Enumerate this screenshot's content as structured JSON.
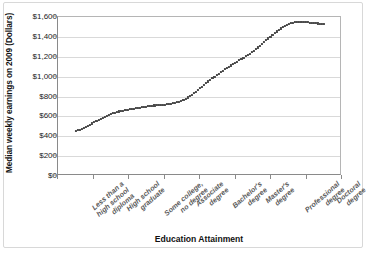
{
  "chart_data": {
    "type": "line",
    "title": "",
    "xlabel": "Education Attainment",
    "ylabel": "Median weekly earnings on 2009 (Dollars)",
    "categories": [
      "Less than a high school diploma",
      "High school graduate",
      "Some college, no degree",
      "Associate degree",
      "Bachelor's degree",
      "Master's degree",
      "Professional degree",
      "Doctoral degree"
    ],
    "values": [
      454,
      626,
      699,
      761,
      1025,
      1257,
      1529,
      1532
    ],
    "ylim": [
      0,
      1600
    ],
    "ytick_values": [
      0,
      200,
      400,
      600,
      800,
      1000,
      1200,
      1400,
      1600
    ],
    "ytick_labels": [
      "$0",
      "$200",
      "$400",
      "$600",
      "$800",
      "$1,000",
      "$1,200",
      "$1,400",
      "$1,600"
    ],
    "grid": true,
    "legend": "none",
    "marker": "dotted-line",
    "series_color": "#4a4a4a"
  },
  "axis": {
    "y_title": "Median weekly earnings on 2009 (Dollars)",
    "x_title": "Education Attainment"
  },
  "x_categories": [
    {
      "line1": "Less than a",
      "line2": "high school",
      "line3": "diploma"
    },
    {
      "line1": "High school",
      "line2": "graduate",
      "line3": ""
    },
    {
      "line1": "Some college,",
      "line2": "no degree",
      "line3": ""
    },
    {
      "line1": "Associate",
      "line2": "degree",
      "line3": ""
    },
    {
      "line1": "Bachelor's",
      "line2": "degree",
      "line3": ""
    },
    {
      "line1": "Master's",
      "line2": "degree",
      "line3": ""
    },
    {
      "line1": "Professional",
      "line2": "degree",
      "line3": ""
    },
    {
      "line1": "Doctoral",
      "line2": "degree",
      "line3": ""
    }
  ]
}
